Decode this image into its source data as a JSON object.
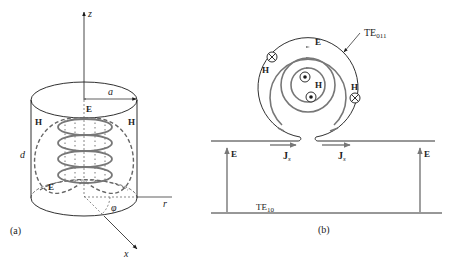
{
  "panel_a": {
    "caption": "(a)",
    "axis_z": "z",
    "axis_x": "x",
    "axis_r": "r",
    "angle": "φ",
    "radius_label": "a",
    "height_label": "d",
    "field_E_top": "E",
    "field_E_bottom": "E",
    "field_H_left": "H",
    "field_H_right": "H"
  },
  "panel_b": {
    "caption": "(b)",
    "cavity_mode": "TE",
    "cavity_mode_sub": "011",
    "guide_mode": "TE",
    "guide_mode_sub": "10",
    "field_E_ring": "E",
    "field_H_center": "H",
    "field_H_left": "H",
    "field_H_right": "H",
    "current_left": "J",
    "current_left_sub": "s",
    "current_right": "J",
    "current_right_sub": "s",
    "guide_E_left": "E",
    "guide_E_right": "E"
  },
  "colors": {
    "line": "#1a1a1a",
    "field": "#777777"
  }
}
